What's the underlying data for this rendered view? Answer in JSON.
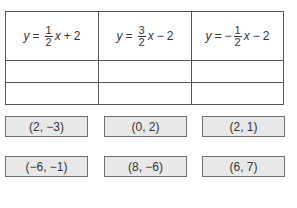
{
  "table": {
    "headers": [
      {
        "lhs": "y",
        "eq": "=",
        "sign": "",
        "num": "1",
        "den": "2",
        "var": "x",
        "op": "+",
        "const": "2"
      },
      {
        "lhs": "y",
        "eq": "=",
        "sign": "",
        "num": "3",
        "den": "2",
        "var": "x",
        "op": "−",
        "const": "2"
      },
      {
        "lhs": "y",
        "eq": "=",
        "sign": "−",
        "num": "1",
        "den": "2",
        "var": "x",
        "op": "−",
        "const": "2"
      }
    ],
    "rows": [
      [
        "",
        "",
        ""
      ],
      [
        "",
        "",
        ""
      ]
    ]
  },
  "tiles": [
    {
      "label": "(2, −3)"
    },
    {
      "label": "(0, 2)"
    },
    {
      "label": "(2, 1)"
    },
    {
      "label": "(−6, −1)"
    },
    {
      "label": "(8, −6)"
    },
    {
      "label": "(6, 7)"
    }
  ]
}
